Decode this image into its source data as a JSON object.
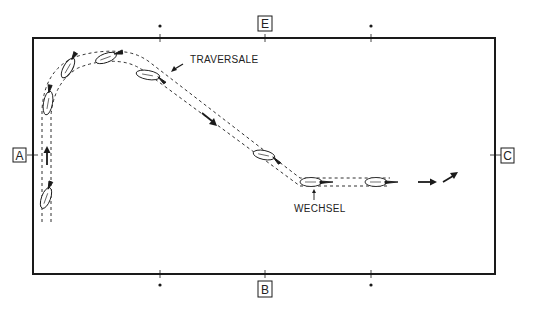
{
  "diagram": {
    "colors": {
      "ink": "#1a1a1a",
      "background": "#ffffff"
    },
    "arena": {
      "x": 33,
      "y": 38,
      "width": 462,
      "height": 236
    },
    "letter_markers": [
      {
        "id": "A",
        "label": "A",
        "side": "left"
      },
      {
        "id": "E",
        "label": "E",
        "side": "top"
      },
      {
        "id": "C",
        "label": "C",
        "side": "right"
      },
      {
        "id": "B",
        "label": "B",
        "side": "bottom"
      }
    ],
    "dot_markers": [
      {
        "position": "top-left"
      },
      {
        "position": "top-right"
      },
      {
        "position": "bottom-left"
      },
      {
        "position": "bottom-right"
      }
    ],
    "annotations": {
      "traversale": "TRAVERSALE",
      "wechsel": "WECHSEL"
    },
    "path": {
      "style": "dashed double track",
      "segments": [
        "up along A side",
        "curve toward E side",
        "diagonal traversale",
        "straight toward C"
      ]
    },
    "horses": 8,
    "direction_arrows": [
      "up",
      "down-right",
      "right",
      "up-right"
    ]
  }
}
